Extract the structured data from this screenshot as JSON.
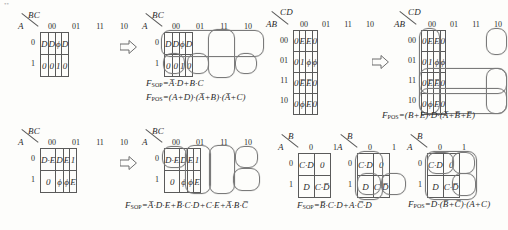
{
  "document": {
    "type": "karnaugh-map-worksheet",
    "artifact_top_left": "••"
  },
  "maps": [
    {
      "id": "map1",
      "col_var": "BC",
      "row_var": "A",
      "col_heads": [
        "00",
        "01",
        "11",
        "10"
      ],
      "row_heads": [
        "0",
        "1"
      ],
      "cells": [
        [
          "D",
          "D",
          "ϕ",
          "D"
        ],
        [
          "0",
          "0",
          "1",
          "0"
        ]
      ]
    },
    {
      "id": "map2",
      "col_var": "BC",
      "row_var": "A",
      "col_heads": [
        "00",
        "01",
        "11",
        "10"
      ],
      "row_heads": [
        "0",
        "1"
      ],
      "cells": [
        [
          "D",
          "D",
          "ϕ",
          "D"
        ],
        [
          "0",
          "0",
          "1",
          "0"
        ]
      ]
    },
    {
      "id": "map3",
      "col_var": "CD",
      "row_var": "AB",
      "col_heads": [
        "00",
        "01",
        "11",
        "10"
      ],
      "row_heads": [
        "00",
        "01",
        "11",
        "10"
      ],
      "cells": [
        [
          "0",
          "E",
          "E",
          "0"
        ],
        [
          "0",
          "1",
          "ϕ",
          "ϕ"
        ],
        [
          "0",
          "E̅",
          "E̅",
          "0"
        ],
        [
          "0",
          "ϕ",
          "E",
          "0"
        ]
      ]
    },
    {
      "id": "map4",
      "col_var": "CD",
      "row_var": "AB",
      "col_heads": [
        "00",
        "01",
        "11",
        "10"
      ],
      "row_heads": [
        "00",
        "01",
        "11",
        "10"
      ],
      "cells": [
        [
          "0",
          "E",
          "E",
          "0"
        ],
        [
          "0",
          "1",
          "ϕ",
          "ϕ"
        ],
        [
          "0",
          "E̅",
          "E̅",
          "0"
        ],
        [
          "0",
          "ϕ",
          "E",
          "0"
        ]
      ]
    },
    {
      "id": "map5",
      "col_var": "BC",
      "row_var": "A",
      "col_heads": [
        "00",
        "01",
        "11",
        "10"
      ],
      "row_heads": [
        "0",
        "1"
      ],
      "cells": [
        [
          "D·E",
          "D",
          "E",
          "1"
        ],
        [
          "0",
          "ϕ",
          "ϕ",
          "E"
        ]
      ]
    },
    {
      "id": "map6",
      "col_var": "BC",
      "row_var": "A",
      "col_heads": [
        "00",
        "01",
        "11",
        "10"
      ],
      "row_heads": [
        "0",
        "1"
      ],
      "cells": [
        [
          "D·E",
          "D",
          "E",
          "1"
        ],
        [
          "0",
          "ϕ",
          "ϕ",
          "E"
        ]
      ]
    },
    {
      "id": "map7",
      "col_var": "B",
      "row_var": "A",
      "col_heads": [
        "0",
        "1"
      ],
      "row_heads": [
        "0",
        "1"
      ],
      "cells": [
        [
          "C·D",
          "0"
        ],
        [
          "D",
          "C·D̅"
        ]
      ]
    },
    {
      "id": "map8",
      "col_var": "B",
      "row_var": "A",
      "col_heads": [
        "0",
        "1"
      ],
      "row_heads": [
        "0",
        "1"
      ],
      "cells": [
        [
          "C·D",
          "0"
        ],
        [
          "D",
          "C·D̅"
        ]
      ]
    },
    {
      "id": "map9",
      "col_var": "B",
      "row_var": "A",
      "col_heads": [
        "0",
        "1"
      ],
      "row_heads": [
        "0",
        "1"
      ],
      "cells": [
        [
          "C·D",
          "0"
        ],
        [
          "D",
          "C·D̅"
        ]
      ]
    }
  ],
  "formulas": {
    "f1_sop_label": "F",
    "f1_sop_sub": "SOP",
    "f1_sop_body": "=A̅·D+B·C",
    "f1_pos_label": "F",
    "f1_pos_sub": "POS",
    "f1_pos_body": "=(A+D)·(A̅+B)·(A̅+C)",
    "f2_pos_label": "F",
    "f2_pos_sub": "POS",
    "f2_pos_body": "=(B+E)·D·(A̅+B̅+E̅)",
    "f3_sop_label": "F",
    "f3_sop_sub": "SOP",
    "f3_sop_body": "=A̅·D·E+B̅·C·D+C·E+A̅·B·C̅",
    "f4_sop_label": "F",
    "f4_sop_sub": "SOP",
    "f4_sop_body": "=B̅·C·D+A·C̅·D",
    "f5_pos_label": "F",
    "f5_pos_sub": "POS",
    "f5_pos_body": "=D·(B̅+C̅)·(A+C)"
  },
  "arrows": {
    "arrow1": "implies-arrow",
    "arrow2": "implies-arrow",
    "arrow3": "implies-arrow"
  }
}
